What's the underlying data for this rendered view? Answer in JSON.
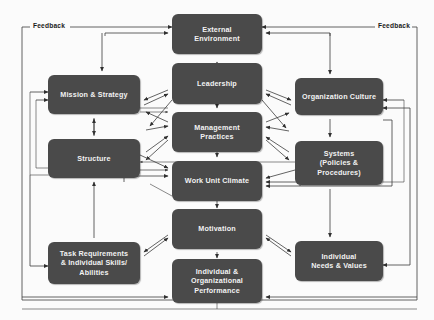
{
  "diagram": {
    "box_color": "#4a4a4a",
    "text_color": "#f2f2f2",
    "line_color": "#3c3c3c",
    "background": "#fbfbfb"
  },
  "labels": {
    "feedback_left": "Feedback",
    "feedback_right": "Feedback"
  },
  "nodes": [
    {
      "id": "external-environment",
      "label": "External\nEnvironment"
    },
    {
      "id": "leadership",
      "label": "Leadership"
    },
    {
      "id": "mission-strategy",
      "label": "Mission & Strategy"
    },
    {
      "id": "organization-culture",
      "label": "Organization Culture"
    },
    {
      "id": "management-practices",
      "label": "Management\nPractices"
    },
    {
      "id": "structure",
      "label": "Structure"
    },
    {
      "id": "systems",
      "label": "Systems\n(Policies &\nProcedures)"
    },
    {
      "id": "work-unit-climate",
      "label": "Work Unit Climate"
    },
    {
      "id": "motivation",
      "label": "Motivation"
    },
    {
      "id": "task-requirements",
      "label": "Task Requirements\n& Individual Skills/\nAbilities"
    },
    {
      "id": "individual-needs",
      "label": "Individual\nNeeds & Values"
    },
    {
      "id": "performance",
      "label": "Individual &\nOrganizational\nPerformance"
    }
  ]
}
